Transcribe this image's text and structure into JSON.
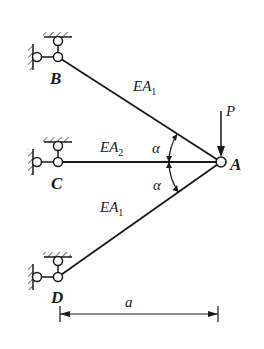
{
  "diagram": {
    "type": "three-bar truss with concentrated load",
    "nodes": {
      "A": {
        "label": "A"
      },
      "B": {
        "label": "B"
      },
      "C": {
        "label": "C"
      },
      "D": {
        "label": "D"
      }
    },
    "members": [
      {
        "from": "B",
        "to": "A",
        "label_main": "EA",
        "label_sub": "1"
      },
      {
        "from": "C",
        "to": "A",
        "label_main": "EA",
        "label_sub": "2"
      },
      {
        "from": "D",
        "to": "A",
        "label_main": "EA",
        "label_sub": "1"
      }
    ],
    "angles": [
      {
        "label": "α",
        "between": [
          "BA",
          "CA"
        ]
      },
      {
        "label": "α",
        "between": [
          "CA",
          "DA"
        ]
      }
    ],
    "load": {
      "label": "P",
      "direction": "down",
      "at": "A"
    },
    "dimension": {
      "label": "a",
      "from": "D",
      "to": "A"
    },
    "supports": [
      "B",
      "C",
      "D"
    ],
    "colors": {
      "line": "#1a1a1a",
      "background": "#ffffff"
    }
  }
}
